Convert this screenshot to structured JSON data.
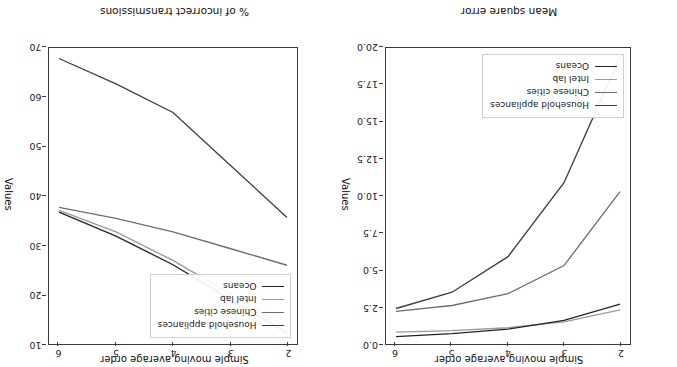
{
  "figure": {
    "orientation": "rotated-180",
    "background": "#ffffff",
    "axis_color": "#3b3b3b"
  },
  "series_colors": {
    "Household appliances": "#3f3f3f",
    "Chinese cities": "#6e6e6e",
    "Intel lab": "#9a9a9a",
    "Oceans": "#242424"
  },
  "chart_data": [
    {
      "type": "line",
      "title": "Mean square error",
      "xlabel": "Simple moving average order",
      "ylabel": "Values",
      "x": [
        2,
        3,
        4,
        5,
        6
      ],
      "xticklabels": [
        "2",
        "3",
        "4",
        "5",
        "6"
      ],
      "yticklabels": [
        "0.0",
        "2.5",
        "5.0",
        "7.5",
        "10.0",
        "12.5",
        "15.0",
        "17.5",
        "20.0"
      ],
      "ylim": [
        0.0,
        20.0
      ],
      "xlim": [
        2,
        6
      ],
      "grid": false,
      "legend_position": "lower left",
      "series": [
        {
          "name": "Household appliances",
          "values": [
            19.4,
            10.9,
            5.9,
            3.5,
            2.4
          ]
        },
        {
          "name": "Chinese cities",
          "values": [
            10.3,
            5.3,
            3.4,
            2.6,
            2.2
          ]
        },
        {
          "name": "Intel lab",
          "values": [
            2.3,
            1.5,
            1.1,
            0.9,
            0.8
          ]
        },
        {
          "name": "Oceans",
          "values": [
            2.7,
            1.6,
            1.0,
            0.7,
            0.5
          ]
        }
      ]
    },
    {
      "type": "line",
      "title": "% of incorrect transmissions",
      "xlabel": "Simple moving average order",
      "ylabel": "Values",
      "x": [
        2,
        3,
        4,
        5,
        6
      ],
      "xticklabels": [
        "2",
        "3",
        "4",
        "5",
        "6"
      ],
      "yticklabels": [
        "10",
        "20",
        "30",
        "40",
        "50",
        "60",
        "70"
      ],
      "ylim": [
        10,
        72
      ],
      "xlim": [
        2,
        6
      ],
      "grid": false,
      "legend_position": "upper left",
      "series": [
        {
          "name": "Household appliances",
          "values": [
            36.5,
            47.5,
            58.5,
            64.5,
            69.8
          ]
        },
        {
          "name": "Chinese cities",
          "values": [
            26.5,
            30.0,
            33.5,
            36.3,
            38.6
          ]
        },
        {
          "name": "Intel lab",
          "values": [
            13.5,
            20.5,
            27.5,
            33.5,
            38.0
          ]
        },
        {
          "name": "Oceans",
          "values": [
            12.3,
            19.4,
            26.6,
            32.6,
            37.6
          ]
        }
      ]
    }
  ],
  "legend_entries": [
    "Household appliances",
    "Chinese cities",
    "Intel lab",
    "Oceans"
  ]
}
